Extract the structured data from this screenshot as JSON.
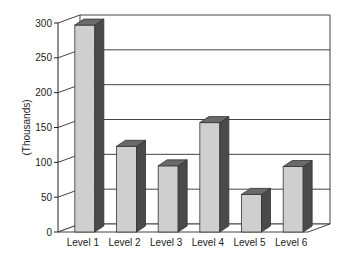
{
  "chart_data": {
    "type": "bar",
    "style": "3d",
    "title": "",
    "xlabel": "",
    "ylabel": "(Thousands)",
    "categories": [
      "Level 1",
      "Level 2",
      "Level 3",
      "Level 4",
      "Level 5",
      "Level 6"
    ],
    "values": [
      297,
      123,
      95,
      157,
      54,
      94
    ],
    "ylim": [
      0,
      300
    ],
    "yticks": [
      0,
      50,
      100,
      150,
      200,
      250,
      300
    ],
    "grid": true,
    "legend": null,
    "colors": {
      "front": "#cfcfcf",
      "side": "#4a4a4a",
      "top": "#6a6a6a"
    }
  }
}
